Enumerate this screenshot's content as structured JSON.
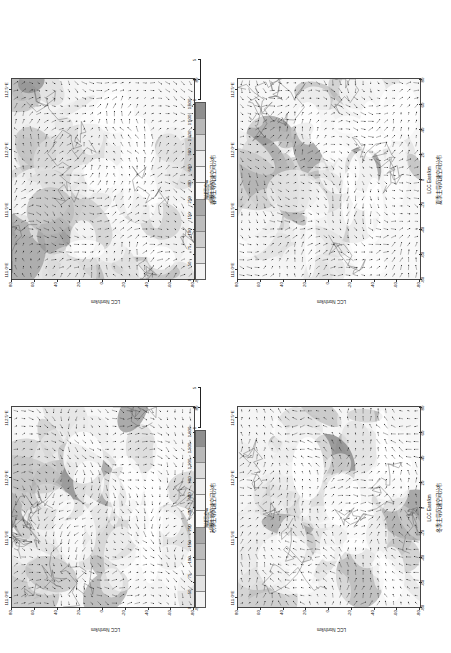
{
  "figure": {
    "layout": "2x2",
    "orientation_deg": -90,
    "panels": [
      {
        "id": "spring",
        "title": "春季主导风速空间分布",
        "x_axis_label": "LCC East/km",
        "y_axis_label": "LCC North/km",
        "x_ticks": [
          "-80",
          "-60",
          "-40",
          "-20",
          "0",
          "20",
          "40",
          "60",
          "80"
        ],
        "y_ticks": [
          "-80",
          "-60",
          "-40",
          "-20",
          "0",
          "20",
          "40",
          "60",
          "80"
        ],
        "lon_ticks": [
          "111.0°E",
          "111.5°E",
          "112.0°E",
          "112.5°E"
        ]
      },
      {
        "id": "summer",
        "title": "夏季主导风速空间分布",
        "x_axis_label": "LCC East/km",
        "y_axis_label": "LCC North/km",
        "x_ticks": [
          "-80",
          "-60",
          "-40",
          "-20",
          "0",
          "20",
          "40",
          "60",
          "80"
        ],
        "y_ticks": [
          "-80",
          "-60",
          "-40",
          "-20",
          "0",
          "20",
          "40",
          "60",
          "80"
        ],
        "lon_ticks": [
          "111.0°E",
          "111.5°E",
          "112.0°E",
          "112.5°E"
        ]
      },
      {
        "id": "autumn",
        "title": "秋季主导风速空间分布",
        "x_axis_label": "LCC East/km",
        "y_axis_label": "LCC North/km",
        "x_ticks": [
          "-80",
          "-60",
          "-40",
          "-20",
          "0",
          "20",
          "40",
          "60",
          "80"
        ],
        "y_ticks": [
          "-80",
          "-60",
          "-40",
          "-20",
          "0",
          "20",
          "40",
          "60",
          "80"
        ],
        "lon_ticks": [
          "111.0°E",
          "111.5°E",
          "112.0°E",
          "112.5°E"
        ]
      },
      {
        "id": "winter",
        "title": "冬季主导风速空间分布",
        "x_axis_label": "LCC East/km",
        "y_axis_label": "LCC North/km",
        "x_ticks": [
          "-80",
          "-60",
          "-40",
          "-20",
          "0",
          "20",
          "40",
          "60",
          "80"
        ],
        "y_ticks": [
          "-80",
          "-60",
          "-40",
          "-20",
          "0",
          "20",
          "40",
          "60",
          "80"
        ],
        "lon_ticks": [
          "111.0°E",
          "111.5°E",
          "112.0°E",
          "112.5°E"
        ]
      }
    ]
  },
  "legend": {
    "elevation_label": "海拔高度/m",
    "wind_label": "风速/（m/s）",
    "elevation_ticks": [
      "0",
      "50",
      "75",
      "100",
      "150",
      "250",
      "400",
      "600",
      "900",
      "1 200",
      "1 500",
      "1 800"
    ],
    "elevation_colors": [
      "#f2f2f2",
      "#e2e2e2",
      "#cfcfcf",
      "#bdbdbd",
      "#ababab",
      "#fbfbfb",
      "#f4f4f4",
      "#ededed",
      "#dcdcdc",
      "#b9b9b9",
      "#8f8f8f"
    ],
    "wind_ticks": [
      "1",
      "3",
      "5"
    ]
  },
  "chart_data": {
    "type": "heatmap",
    "xlabel": "LCC East/km",
    "ylabel": "LCC North/km",
    "xlim": [
      -90,
      90
    ],
    "ylim": [
      -90,
      90
    ],
    "grid": false,
    "legend_position": "top",
    "colorbar_label": "海拔高度/m",
    "colorbar_levels": [
      0,
      50,
      75,
      100,
      150,
      250,
      400,
      600,
      900,
      1200,
      1500,
      1800
    ],
    "quiver_key_label": "风速/（m/s）",
    "quiver_key_values": [
      1,
      3,
      5
    ],
    "series": [
      {
        "name": "春季主导风速空间分布",
        "panel": 0,
        "mean_speed": 2.6
      },
      {
        "name": "夏季主导风速空间分布",
        "panel": 1,
        "mean_speed": 2.1
      },
      {
        "name": "秋季主导风速空间分布",
        "panel": 2,
        "mean_speed": 2.3
      },
      {
        "name": "冬季主导风速空间分布",
        "panel": 3,
        "mean_speed": 2.9
      }
    ]
  }
}
